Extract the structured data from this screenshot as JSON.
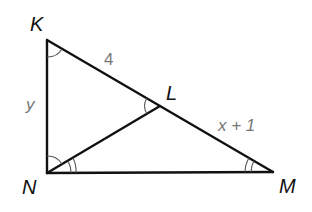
{
  "figure": {
    "type": "geometry-diagram",
    "vertices": [
      {
        "id": "K",
        "label": "K"
      },
      {
        "id": "L",
        "label": "L"
      },
      {
        "id": "M",
        "label": "M"
      },
      {
        "id": "N",
        "label": "N"
      }
    ],
    "segments": [
      {
        "from": "K",
        "to": "N"
      },
      {
        "from": "K",
        "to": "M"
      },
      {
        "from": "N",
        "to": "M"
      },
      {
        "from": "N",
        "to": "L"
      }
    ],
    "measures": {
      "KL": "4",
      "LM": "x + 1",
      "KN": "y"
    },
    "congruent_angles": [
      {
        "group": "single-arc",
        "angles": [
          "∠NKL",
          "∠KLN"
        ]
      },
      {
        "group": "double-arc",
        "angles": [
          "∠LNM",
          "∠LMN"
        ]
      }
    ],
    "angle_marks": [
      {
        "vertex": "K",
        "arcs": 1
      },
      {
        "vertex": "L",
        "arcs": 1
      },
      {
        "vertex": "N",
        "arcs": 1,
        "note": "angle KNL"
      },
      {
        "vertex": "N",
        "arcs": 2,
        "note": "angle LNM"
      },
      {
        "vertex": "M",
        "arcs": 2
      }
    ],
    "colors": {
      "lines": "#111111",
      "measure_text": "#777777",
      "arc_marks": "#555555"
    }
  }
}
